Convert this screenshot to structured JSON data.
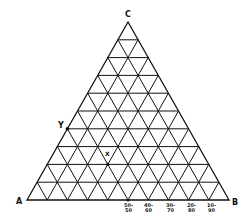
{
  "diagram": {
    "type": "ternary-grid",
    "divisions": 10,
    "vertices": {
      "A": {
        "label": "A"
      },
      "B": {
        "label": "B"
      },
      "C": {
        "label": "C"
      }
    },
    "points": [
      {
        "label": "Y",
        "note": "on side AC, 40% up toward C"
      },
      {
        "label": "X",
        "note": "interior point on 20% C grid line"
      }
    ],
    "base_labels": [
      {
        "top": "50-",
        "bottom": "50"
      },
      {
        "top": "40-",
        "bottom": "60"
      },
      {
        "top": "30-",
        "bottom": "70"
      },
      {
        "top": "20-",
        "bottom": "80"
      },
      {
        "top": "10-",
        "bottom": "90"
      }
    ],
    "colors": {
      "line": "#111111",
      "background": "#ffffff"
    }
  }
}
